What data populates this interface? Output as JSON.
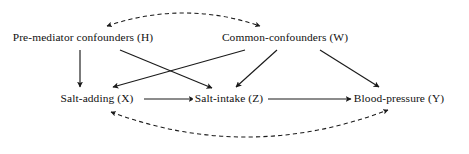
{
  "diagram": {
    "type": "causal-dag",
    "width": 469,
    "height": 154,
    "background_color": "#ffffff",
    "line_color": "#1a1a1a",
    "text_color": "#101010",
    "nodes": [
      {
        "id": "H",
        "label": "Pre-mediator confounders (H)",
        "variable": "H",
        "x": 83,
        "y": 38,
        "row": "top"
      },
      {
        "id": "W",
        "label": "Common-confounders (W)",
        "variable": "W",
        "x": 285,
        "y": 38,
        "row": "top"
      },
      {
        "id": "X",
        "label": "Salt-adding (X)",
        "variable": "X",
        "x": 97,
        "y": 99,
        "row": "bottom"
      },
      {
        "id": "Z",
        "label": "Salt-intake (Z)",
        "variable": "Z",
        "x": 229,
        "y": 99,
        "row": "bottom"
      },
      {
        "id": "Y",
        "label": "Blood-pressure (Y)",
        "variable": "Y",
        "x": 399,
        "y": 99,
        "row": "bottom"
      }
    ],
    "edges": [
      {
        "id": "H-X",
        "from": "H",
        "to": "X",
        "style": "solid",
        "direction": "forward"
      },
      {
        "id": "H-Z",
        "from": "H",
        "to": "Z",
        "style": "solid",
        "direction": "forward"
      },
      {
        "id": "W-X",
        "from": "W",
        "to": "X",
        "style": "solid",
        "direction": "forward"
      },
      {
        "id": "W-Z",
        "from": "W",
        "to": "Z",
        "style": "solid",
        "direction": "forward"
      },
      {
        "id": "W-Y",
        "from": "W",
        "to": "Y",
        "style": "solid",
        "direction": "forward"
      },
      {
        "id": "X-Z",
        "from": "X",
        "to": "Z",
        "style": "solid",
        "direction": "forward"
      },
      {
        "id": "Z-Y",
        "from": "Z",
        "to": "Y",
        "style": "solid",
        "direction": "forward"
      },
      {
        "id": "H-W",
        "from": "H",
        "to": "W",
        "style": "dashed",
        "direction": "bidirectional"
      },
      {
        "id": "X-Y",
        "from": "X",
        "to": "Y",
        "style": "dashed",
        "direction": "bidirectional"
      }
    ]
  }
}
